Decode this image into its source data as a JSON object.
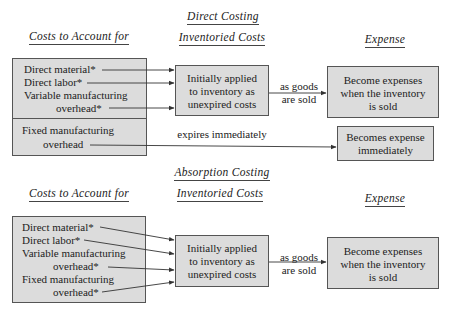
{
  "direct_costing": {
    "title": "Direct Costing",
    "col_costs": "Costs to Account for",
    "col_inventoried": "Inventoried Costs",
    "col_expense": "Expense",
    "costs_box_upper": {
      "items": [
        "Direct material*",
        "Direct labor*",
        "Variable manufacturing",
        "overhead*"
      ]
    },
    "costs_box_lower": {
      "items": [
        "Fixed manufacturing",
        "overhead"
      ]
    },
    "inventory_box": [
      "Initially applied",
      "to inventory as",
      "unexpired costs"
    ],
    "sold_label": [
      "as goods",
      "are sold"
    ],
    "expense_box": [
      "Become expenses",
      "when the inventory",
      "is sold"
    ],
    "expires_label": "expires immediately",
    "period_expense_box": [
      "Becomes expense",
      "immediately"
    ]
  },
  "absorption_costing": {
    "title": "Absorption Costing",
    "col_costs": "Costs to Account for",
    "col_inventoried": "Inventoried Costs",
    "col_expense": "Expense",
    "costs_box": {
      "items": [
        "Direct material*",
        "Direct labor*",
        "Variable manufacturing",
        "overhead*",
        "Fixed manufacturing",
        "overhead*"
      ]
    },
    "inventory_box": [
      "Initially applied",
      "to inventory as",
      "unexpired costs"
    ],
    "sold_label": [
      "as goods",
      "are sold"
    ],
    "expense_box": [
      "Become expenses",
      "when the inventory",
      "is sold"
    ]
  },
  "colors": {
    "box_fill": "#dcdcdc",
    "box_border": "#555555",
    "line": "#333333"
  }
}
